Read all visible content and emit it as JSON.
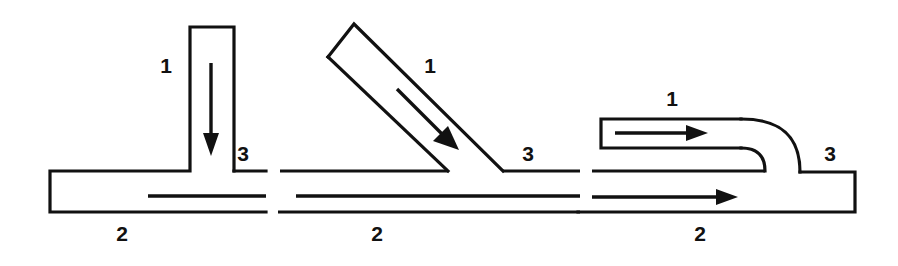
{
  "figure": {
    "stroke_color": "#111111",
    "background_color": "#ffffff",
    "label_font_size_px": 21
  },
  "labels": {
    "branch": "1",
    "main": "2",
    "combined": "3"
  },
  "panels": [
    {
      "name": "perpendicular-tee",
      "branch_label": "1",
      "main_label": "2",
      "combined_label": "3",
      "branch_angle_deg": 90,
      "branch_flow_direction": "down",
      "main_flow_direction": "right",
      "label_positions": {
        "branch": {
          "x": 166,
          "y": 67
        },
        "main": {
          "x": 122,
          "y": 235
        },
        "combined": {
          "x": 243,
          "y": 155
        }
      }
    },
    {
      "name": "angled-wye",
      "branch_label": "1",
      "main_label": "2",
      "combined_label": "3",
      "branch_angle_deg": 45,
      "branch_flow_direction": "down-right",
      "main_flow_direction": "right",
      "label_positions": {
        "branch": {
          "x": 430,
          "y": 67
        },
        "main": {
          "x": 377,
          "y": 235
        },
        "combined": {
          "x": 528,
          "y": 155
        }
      }
    },
    {
      "name": "curved-elbow-merge",
      "branch_label": "1",
      "main_label": "2",
      "combined_label": "3",
      "branch_angle_deg": 0,
      "branch_flow_direction": "right",
      "main_flow_direction": "right",
      "label_positions": {
        "branch": {
          "x": 672,
          "y": 100
        },
        "main": {
          "x": 700,
          "y": 235
        },
        "combined": {
          "x": 830,
          "y": 155
        }
      }
    }
  ]
}
